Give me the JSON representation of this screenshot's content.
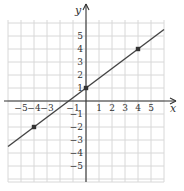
{
  "chart_data": {
    "type": "line",
    "title": "",
    "xlabel": "x",
    "ylabel": "y",
    "xlim": [
      -6,
      6
    ],
    "ylim": [
      -6,
      6
    ],
    "grid": true,
    "x_tick_labels": [
      "-5",
      "-4",
      "-3",
      "-1",
      "1",
      "2",
      "3",
      "4",
      "5"
    ],
    "y_tick_labels": [
      "5",
      "4",
      "3",
      "2",
      "1",
      "-1",
      "-2",
      "-3",
      "-4",
      "-5"
    ],
    "series": [
      {
        "name": "line",
        "equation": "y = (3/4)x + 1",
        "slope": 0.75,
        "intercept": 1,
        "line_extent_x": [
          -6,
          6
        ],
        "marked_points": [
          {
            "x": -4,
            "y": -2
          },
          {
            "x": 0,
            "y": 1
          },
          {
            "x": 4,
            "y": 4
          }
        ]
      }
    ],
    "colors": {
      "line": "#444444",
      "grid": "#d8d8d8",
      "axis": "#333333"
    }
  },
  "labels": {
    "x_axis": "x",
    "y_axis": "y",
    "x_ticks": [
      {
        "v": -5,
        "t": "−5"
      },
      {
        "v": -4,
        "t": "−4"
      },
      {
        "v": -3,
        "t": "−3"
      },
      {
        "v": -1,
        "t": "−1"
      },
      {
        "v": 1,
        "t": "1"
      },
      {
        "v": 2,
        "t": "2"
      },
      {
        "v": 3,
        "t": "3"
      },
      {
        "v": 4,
        "t": "4"
      },
      {
        "v": 5,
        "t": "5"
      }
    ],
    "y_ticks": [
      {
        "v": 5,
        "t": "5"
      },
      {
        "v": 4,
        "t": "4"
      },
      {
        "v": 3,
        "t": "3"
      },
      {
        "v": 2,
        "t": "2"
      },
      {
        "v": 1,
        "t": "1"
      },
      {
        "v": -1,
        "t": "−1"
      },
      {
        "v": -2,
        "t": "−2"
      },
      {
        "v": -3,
        "t": "−3"
      },
      {
        "v": -4,
        "t": "−4"
      },
      {
        "v": -5,
        "t": "−5"
      }
    ]
  }
}
